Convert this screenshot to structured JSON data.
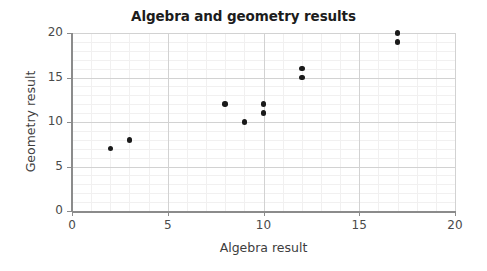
{
  "chart_data": {
    "type": "scatter",
    "title": "Algebra and geometry results",
    "xlabel": "Algebra result",
    "ylabel": "Geometry result",
    "xlim": [
      0,
      20
    ],
    "ylim": [
      0,
      20
    ],
    "xticks": [
      0,
      5,
      10,
      15,
      20
    ],
    "yticks": [
      0,
      5,
      10,
      15,
      20
    ],
    "xtick_labels": [
      "0",
      "5",
      "10",
      "15",
      "20"
    ],
    "ytick_labels": [
      "0",
      "5",
      "10",
      "15",
      "20"
    ],
    "grid": true,
    "minor_grid": true,
    "minor_tick_step": 1,
    "legend": null,
    "marker": "circle",
    "marker_color": "#1a1a1a",
    "points": [
      {
        "x": 2,
        "y": 7
      },
      {
        "x": 3,
        "y": 8
      },
      {
        "x": 8,
        "y": 12
      },
      {
        "x": 9,
        "y": 10
      },
      {
        "x": 10,
        "y": 11
      },
      {
        "x": 10,
        "y": 12
      },
      {
        "x": 12,
        "y": 15
      },
      {
        "x": 12,
        "y": 16
      },
      {
        "x": 17,
        "y": 19
      },
      {
        "x": 17,
        "y": 20
      }
    ]
  },
  "colors": {
    "background": "#ffffff",
    "title": "#1c1c1c",
    "axis_line": "#8b8b8b",
    "major_grid": "#d2d2d2",
    "minor_grid": "#f1f0f0",
    "tick_label": "#4a4a4a",
    "axis_label": "#3d3d3d",
    "marker": "#1a1a1a"
  }
}
